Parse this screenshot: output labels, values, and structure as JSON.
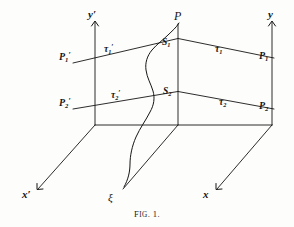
{
  "figure": {
    "caption_prefix": "F",
    "caption_smallcaps": "IG",
    "caption_number": ". 1.",
    "caption_full": "Fig. 1.",
    "background_color": "#fdfdfc",
    "ink_color": "#151515"
  },
  "axes": [
    {
      "id": "y-prime",
      "label": "y",
      "prime": "′",
      "name": "y-prime-axis-label"
    },
    {
      "id": "y",
      "label": "y",
      "prime": "",
      "name": "y-axis-label"
    },
    {
      "id": "x-prime",
      "label": "x",
      "prime": "′",
      "name": "x-prime-axis-label"
    },
    {
      "id": "x",
      "label": "x",
      "prime": "",
      "name": "x-axis-label"
    }
  ],
  "labels": {
    "y_prime": "y′",
    "y": "y",
    "x_prime": "x′",
    "x": "x",
    "P": "P",
    "xi": "ξ",
    "P1_prime_base": "P",
    "P1_prime_sub": "1",
    "P1_prime_mark": "′",
    "P2_prime_base": "P",
    "P2_prime_sub": "2",
    "P2_prime_mark": "′",
    "P1_base": "P",
    "P1_sub": "1",
    "P2_base": "P",
    "P2_sub": "2",
    "tau1_prime_base": "τ",
    "tau1_prime_sub": "1",
    "tau1_prime_mark": "′",
    "tau2_prime_base": "τ",
    "tau2_prime_sub": "2",
    "tau2_prime_mark": "′",
    "tau1_base": "τ",
    "tau1_sub": "1",
    "tau2_base": "τ",
    "tau2_sub": "2",
    "S1_base": "S",
    "S1_sub": "1",
    "S2_base": "S",
    "S2_sub": "2"
  },
  "geometry_notes": {
    "left_vertical_x": 95,
    "center_vertical_x": 178,
    "right_vertical_x": 272,
    "top_y": 22,
    "base_y": 125,
    "upper_line_left_y": 62,
    "upper_line_center_y": 38,
    "upper_line_right_y": 57,
    "lower_line_left_y": 108,
    "lower_line_center_y": 91,
    "lower_line_right_y": 108
  }
}
